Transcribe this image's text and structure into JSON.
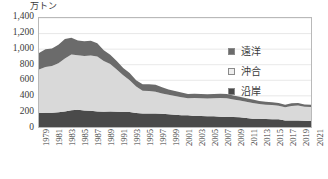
{
  "chart_data": {
    "type": "area",
    "stacked": true,
    "title": "",
    "subtitle": "",
    "unit_label": "万トン",
    "xlabel": "",
    "ylabel": "",
    "ylim": [
      0,
      1400
    ],
    "yticks": [
      0,
      200,
      400,
      600,
      800,
      1000,
      1200,
      1400
    ],
    "ytick_labels": [
      "0",
      "200",
      "400",
      "600",
      "800",
      "1,000",
      "1,200",
      "1,400"
    ],
    "grid": true,
    "legend_position": "inside-right",
    "x": [
      1979,
      1980,
      1981,
      1982,
      1983,
      1984,
      1985,
      1986,
      1987,
      1988,
      1989,
      1990,
      1991,
      1992,
      1993,
      1994,
      1995,
      1996,
      1997,
      1998,
      1999,
      2000,
      2001,
      2002,
      2003,
      2004,
      2005,
      2006,
      2007,
      2008,
      2009,
      2010,
      2011,
      2012,
      2013,
      2014,
      2015,
      2016,
      2017,
      2018,
      2019,
      2020,
      2021
    ],
    "xtick_labels": [
      "1979",
      "1981",
      "1983",
      "1985",
      "1987",
      "1989",
      "1991",
      "1993",
      "1995",
      "1997",
      "1999",
      "2001",
      "2003",
      "2005",
      "2007",
      "2009",
      "2011",
      "2013",
      "2015",
      "2017",
      "2019",
      "2021"
    ],
    "series": [
      {
        "name": "沿岸",
        "color": "#4a4a4a",
        "stack_order": 1,
        "values": [
          180,
          182,
          184,
          188,
          200,
          215,
          220,
          212,
          208,
          200,
          197,
          199,
          197,
          194,
          192,
          180,
          175,
          173,
          174,
          170,
          163,
          158,
          152,
          150,
          142,
          140,
          137,
          138,
          133,
          130,
          127,
          124,
          115,
          107,
          105,
          102,
          101,
          98,
          85,
          84,
          85,
          80,
          78
        ]
      },
      {
        "name": "沖合",
        "color": "#d9d9d9",
        "stack_order": 2,
        "values": [
          560,
          590,
          600,
          630,
          680,
          715,
          700,
          700,
          710,
          705,
          650,
          610,
          540,
          470,
          410,
          340,
          290,
          290,
          280,
          260,
          250,
          240,
          230,
          220,
          230,
          230,
          230,
          230,
          240,
          240,
          225,
          215,
          210,
          200,
          190,
          185,
          180,
          175,
          170,
          185,
          190,
          180,
          180
        ]
      },
      {
        "name": "遠洋",
        "color": "#6b6b6b",
        "stack_order": 3,
        "values": [
          210,
          225,
          225,
          240,
          250,
          215,
          190,
          190,
          190,
          170,
          140,
          120,
          110,
          95,
          90,
          80,
          85,
          85,
          90,
          80,
          70,
          65,
          60,
          55,
          55,
          55,
          55,
          55,
          55,
          55,
          52,
          50,
          45,
          45,
          40,
          38,
          36,
          34,
          32,
          35,
          33,
          30,
          28
        ]
      }
    ],
    "totals": [
      950,
      997,
      1009,
      1058,
      1130,
      1145,
      1110,
      1102,
      1108,
      1075,
      987,
      929,
      847,
      759,
      692,
      600,
      550,
      548,
      544,
      510,
      483,
      463,
      442,
      425,
      427,
      425,
      422,
      423,
      428,
      425,
      404,
      389,
      370,
      352,
      335,
      325,
      317,
      307,
      287,
      304,
      308,
      290,
      286
    ]
  },
  "legend": {
    "items": [
      {
        "label": "遠洋",
        "swatch_color": "#6b6b6b",
        "name": "distant-water"
      },
      {
        "label": "沖合",
        "swatch_color": "#eeeeee",
        "name": "offshore"
      },
      {
        "label": "沿岸",
        "swatch_color": "#4a4a4a",
        "name": "coastal"
      }
    ]
  }
}
